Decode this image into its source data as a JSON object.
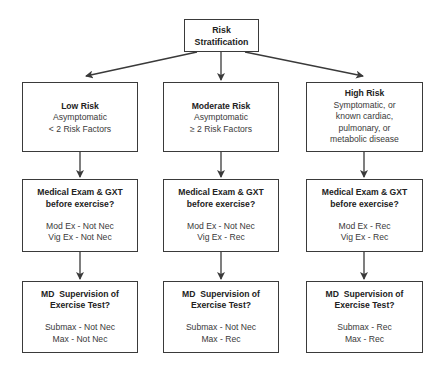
{
  "diagram": {
    "root": {
      "title_line1": "Risk",
      "title_line2": "Stratification"
    },
    "categories": [
      {
        "title": "Low Risk",
        "lines": [
          "Asymptomatic",
          "< 2 Risk Factors"
        ]
      },
      {
        "title": "Moderate Risk",
        "lines": [
          "Asymptomatic",
          "≥ 2 Risk Factors"
        ]
      },
      {
        "title": "High Risk",
        "lines": [
          "Symptomatic, or",
          "known cardiac,",
          "pulmonary, or",
          "metabolic disease"
        ]
      }
    ],
    "medical_exam": [
      {
        "title_line1": "Medical Exam & GXT",
        "title_line2": "before exercise?",
        "mod": "Mod Ex - Not Nec",
        "vig": "Vig Ex - Not Nec"
      },
      {
        "title_line1": "Medical Exam & GXT",
        "title_line2": "before exercise?",
        "mod": "Mod Ex - Not Nec",
        "vig": "Vig Ex - Rec"
      },
      {
        "title_line1": "Medical Exam & GXT",
        "title_line2": "before exercise?",
        "mod": "Mod Ex - Rec",
        "vig": "Vig Ex - Rec"
      }
    ],
    "md_supervision": [
      {
        "title_line1": "MD  Supervision of",
        "title_line2": "Exercise Test?",
        "submax": "Submax - Not Nec",
        "max": "Max - Not Nec"
      },
      {
        "title_line1": "MD  Supervision of",
        "title_line2": "Exercise Test?",
        "submax": "Submax - Not Nec",
        "max": "Max - Rec"
      },
      {
        "title_line1": "MD  Supervision of",
        "title_line2": "Exercise Test?",
        "submax": "Submax - Rec",
        "max": "Max - Rec"
      }
    ],
    "colors": {
      "border": "#3a3a3a",
      "text": "#2a2a2a",
      "arrow": "#3a3a3a",
      "background": "#ffffff"
    }
  }
}
